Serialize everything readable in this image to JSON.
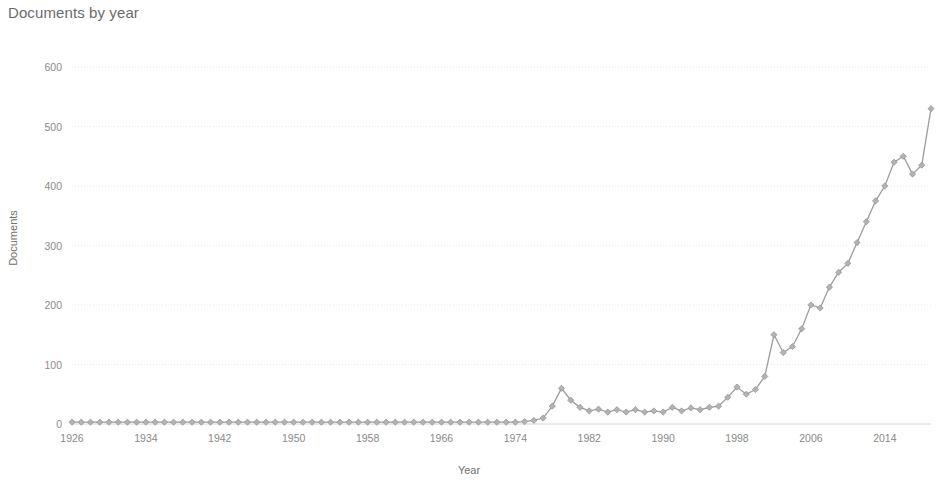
{
  "chart_data": {
    "type": "line",
    "title": "Documents by year",
    "xlabel": "Year",
    "ylabel": "Documents",
    "grid": true,
    "legend": "none",
    "xlim": [
      1926,
      2019
    ],
    "ylim": [
      0,
      600
    ],
    "ytick_labels": [
      "0",
      "100",
      "200",
      "300",
      "400",
      "500",
      "600"
    ],
    "ytick_values": [
      0,
      100,
      200,
      300,
      400,
      500,
      600
    ],
    "xtick_labels": [
      "1926",
      "1934",
      "1942",
      "1950",
      "1958",
      "1966",
      "1974",
      "1982",
      "1990",
      "1998",
      "2006",
      "2014"
    ],
    "xtick_values": [
      1926,
      1934,
      1942,
      1950,
      1958,
      1966,
      1974,
      1982,
      1990,
      1998,
      2006,
      2014
    ],
    "marker": "diamond",
    "line_color": "#9d9d9d",
    "marker_color": "#b3b3b3",
    "grid_color": "#e9e9e9",
    "text_color": "#6f6f6f",
    "x": [
      1926,
      1927,
      1928,
      1929,
      1930,
      1931,
      1932,
      1933,
      1934,
      1935,
      1936,
      1937,
      1938,
      1939,
      1940,
      1941,
      1942,
      1943,
      1944,
      1945,
      1946,
      1947,
      1948,
      1949,
      1950,
      1951,
      1952,
      1953,
      1954,
      1955,
      1956,
      1957,
      1958,
      1959,
      1960,
      1961,
      1962,
      1963,
      1964,
      1965,
      1966,
      1967,
      1968,
      1969,
      1970,
      1971,
      1972,
      1973,
      1974,
      1975,
      1976,
      1977,
      1978,
      1979,
      1980,
      1981,
      1982,
      1983,
      1984,
      1985,
      1986,
      1987,
      1988,
      1989,
      1990,
      1991,
      1992,
      1993,
      1994,
      1995,
      1996,
      1997,
      1998,
      1999,
      2000,
      2001,
      2002,
      2003,
      2004,
      2005,
      2006,
      2007,
      2008,
      2009,
      2010,
      2011,
      2012,
      2013,
      2014,
      2015,
      2016,
      2017,
      2018,
      2019
    ],
    "y": [
      3,
      3,
      3,
      3,
      3,
      3,
      3,
      3,
      3,
      3,
      3,
      3,
      3,
      3,
      3,
      3,
      3,
      3,
      3,
      3,
      3,
      3,
      3,
      3,
      3,
      3,
      3,
      3,
      3,
      3,
      3,
      3,
      3,
      3,
      3,
      3,
      3,
      3,
      3,
      3,
      3,
      3,
      3,
      3,
      3,
      3,
      3,
      3,
      3,
      4,
      6,
      10,
      30,
      60,
      40,
      28,
      22,
      25,
      20,
      24,
      20,
      24,
      20,
      22,
      20,
      28,
      22,
      27,
      24,
      28,
      30,
      45,
      62,
      50,
      58,
      80,
      150,
      120,
      130,
      160,
      200,
      195,
      230,
      255,
      270,
      305,
      340,
      375,
      400,
      440,
      450,
      420,
      435,
      530
    ]
  }
}
